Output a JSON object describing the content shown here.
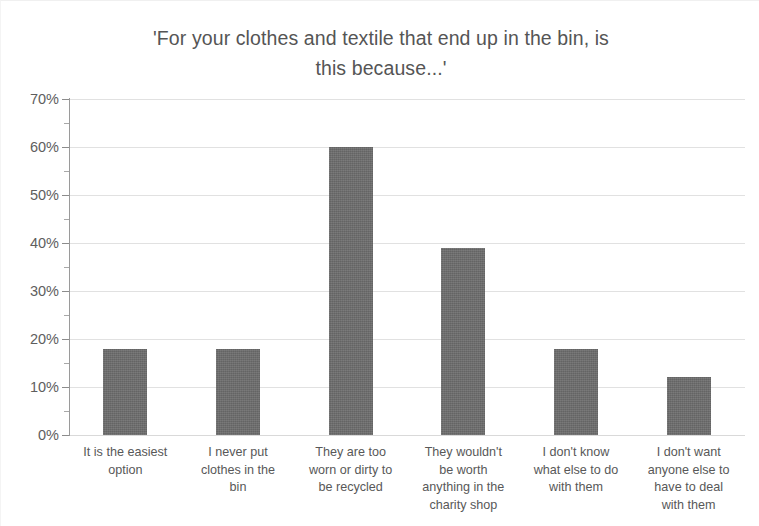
{
  "chart_data": {
    "type": "bar",
    "title": "'For your clothes and textile that end up in the bin, is\nthis because...'",
    "xlabel": "",
    "ylabel": "",
    "ylim": [
      0,
      70
    ],
    "ytick_step": 10,
    "yminor_step": 5,
    "grid": true,
    "legend": false,
    "value_suffix": "%",
    "categories": [
      "It is the easiest\noption",
      "I never put\nclothes in the\nbin",
      "They are too\nworn or dirty to\nbe recycled",
      "They wouldn't\nbe worth\nanything in the\ncharity shop",
      "I don't know\nwhat else to do\nwith them",
      "I don't want\nanyone else to\nhave to deal\nwith them"
    ],
    "values": [
      18,
      18,
      60,
      39,
      18,
      12
    ],
    "ytick_labels": [
      "70%",
      "60%",
      "50%",
      "40%",
      "30%",
      "20%",
      "10%",
      "0%"
    ],
    "ytick_values": [
      70,
      60,
      50,
      40,
      30,
      20,
      10,
      0
    ],
    "bar_color": "#6d6d6d",
    "grid_color": "#dcdcdc",
    "axis_color": "#9a9a9a",
    "text_color": "#585858",
    "title_color": "#555555"
  }
}
